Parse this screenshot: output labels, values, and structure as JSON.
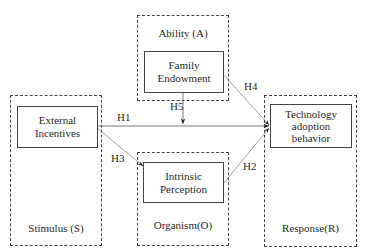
{
  "diagram": {
    "groups": {
      "stimulus": {
        "label": "Stimulus (S)"
      },
      "ability": {
        "label": "Ability (A)"
      },
      "organism": {
        "label": "Organism(O)"
      },
      "response": {
        "label": "Response(R)"
      }
    },
    "nodes": {
      "external_incentives": {
        "label": "External\nIncentives"
      },
      "family_endowment": {
        "label": "Family\nEndowment"
      },
      "intrinsic_perception": {
        "label": "Intrinsic\nPerception"
      },
      "technology_adoption": {
        "label": "Technology\nadoption\nbehavior"
      }
    },
    "edges": [
      {
        "id": "H1",
        "label": "H1",
        "from": "External Incentives",
        "to": "Technology adoption behavior"
      },
      {
        "id": "H2",
        "label": "H2",
        "from": "Intrinsic Perception",
        "to": "Technology adoption behavior"
      },
      {
        "id": "H3",
        "label": "H3",
        "from": "External Incentives",
        "to": "Intrinsic Perception"
      },
      {
        "id": "H4",
        "label": "H4",
        "from": "Family Endowment",
        "to": "Technology adoption behavior"
      },
      {
        "id": "H5",
        "label": "H5",
        "from": "Family Endowment",
        "to": "H1 path (moderation)"
      }
    ]
  }
}
